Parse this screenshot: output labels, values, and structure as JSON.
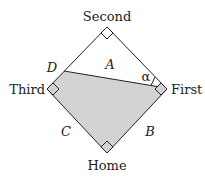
{
  "diagram": {
    "bases": {
      "second": {
        "label": "Second",
        "x": 107,
        "y": 27
      },
      "first": {
        "label": "First",
        "x": 167,
        "y": 89
      },
      "home": {
        "label": "Home",
        "x": 107,
        "y": 153
      },
      "third": {
        "label": "Third",
        "x": 47,
        "y": 89
      }
    },
    "point_d": {
      "label": "D",
      "x": 64,
      "y": 71
    },
    "line_end": {
      "x": 160,
      "y": 87
    },
    "region_labels": {
      "A": "A",
      "B": "B",
      "C": "C"
    },
    "angle_label": "α",
    "colors": {
      "stroke": "#222222",
      "shade": "#d3d3d3",
      "background": "#ffffff"
    }
  }
}
